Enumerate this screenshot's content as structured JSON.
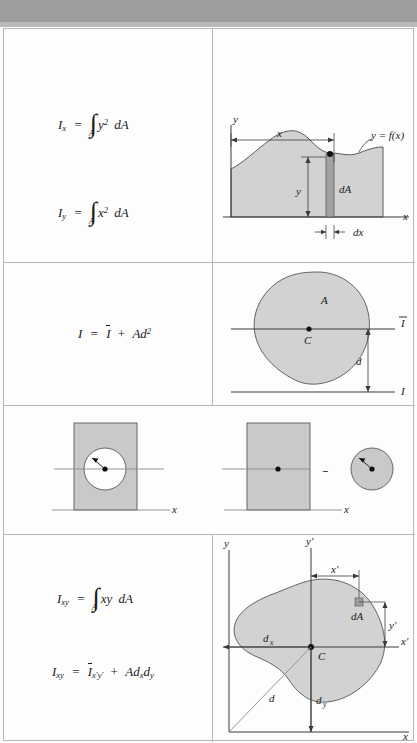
{
  "figure": {
    "type": "reference-table",
    "rows": 4,
    "columns": 2,
    "colors": {
      "top_band": "#9d9d9d",
      "area_fill": "#d2d2d2",
      "rect_fill": "#c9c9c9",
      "line": "#3a3a3a",
      "grid": "#b8b8b8",
      "page": "#fdfdfd"
    }
  },
  "row1": {
    "formulas": {
      "ix": {
        "lhs": "I",
        "lhs_sub": "x",
        "eq": "=",
        "integral": "∫",
        "int_sub": "A",
        "body": "y",
        "body_sup": "2",
        "diff": "dA"
      },
      "iy": {
        "lhs": "I",
        "lhs_sub": "y",
        "eq": "=",
        "integral": "∫",
        "int_sub": "A",
        "body": "x",
        "body_sup": "2",
        "diff": "dA"
      }
    },
    "diagram": {
      "name": "area-under-curve",
      "labels": {
        "y_axis": "y",
        "x_axis": "x",
        "width_x": "x",
        "height_y": "y",
        "curve": "y = f(x)",
        "element": "dA",
        "strip_width": "dx"
      }
    }
  },
  "row2": {
    "formula": {
      "lhs": "I",
      "eq": "=",
      "ibar": "I",
      "plus": "+",
      "area": "A",
      "d": "d",
      "d_sup": "2"
    },
    "diagram": {
      "name": "parallel-axis-blob",
      "labels": {
        "area": "A",
        "centroid": "C",
        "centroid_axis": "I",
        "ref_axis": "I",
        "distance": "d"
      }
    }
  },
  "row3": {
    "diagram_left": {
      "name": "rectangle-with-hole",
      "labels": {
        "axis": "x"
      }
    },
    "diagram_right": {
      "name": "rectangle-minus-circle",
      "labels": {
        "axis": "x",
        "operator": "−"
      }
    }
  },
  "row4": {
    "formulas": {
      "ixy_integral": {
        "lhs": "I",
        "lhs_sub": "xy",
        "eq": "=",
        "integral": "∫",
        "int_sub": "A",
        "body": "xy",
        "diff": "dA"
      },
      "ixy_parallel": {
        "lhs": "I",
        "lhs_sub": "xy",
        "eq": "=",
        "ibar": "I",
        "ibar_sub": "x′y′",
        "plus": "+",
        "area": "A",
        "dx": "d",
        "dx_sub": "x",
        "dy": "d",
        "dy_sub": "y"
      }
    },
    "diagram": {
      "name": "product-of-inertia-blob",
      "labels": {
        "y_axis": "y",
        "yprime_axis": "y′",
        "x_axis": "x",
        "xprime_axis": "x′",
        "xprime_dim": "x′",
        "yprime_dim": "y′",
        "element": "dA",
        "centroid": "C",
        "dx": "d",
        "dx_sub": "x",
        "dy": "d",
        "dy_sub": "y",
        "d": "d"
      }
    }
  }
}
